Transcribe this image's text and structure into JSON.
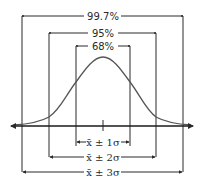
{
  "diagram": {
    "top_ranges": [
      {
        "label": "99.7%",
        "left_x": 22,
        "right_x": 183,
        "y": 16
      },
      {
        "label": "95%",
        "left_x": 49,
        "right_x": 156,
        "y": 33
      },
      {
        "label": "68%",
        "left_x": 76,
        "right_x": 130,
        "y": 46
      }
    ],
    "bottom_ranges": [
      {
        "label": "x̄ ± 1σ",
        "left_x": 76,
        "right_x": 130,
        "y": 142
      },
      {
        "label": "x̄ ± 2σ",
        "left_x": 49,
        "right_x": 156,
        "y": 157
      },
      {
        "label": "x̄ ± 3σ",
        "left_x": 22,
        "right_x": 183,
        "y": 172
      }
    ],
    "axis": {
      "y": 126,
      "x_start": 10,
      "x_end": 194,
      "center_x": 103
    },
    "colors": {
      "line": "#2a2a2a",
      "curve": "#555555",
      "background": "#ffffff"
    }
  }
}
